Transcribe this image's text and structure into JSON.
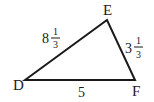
{
  "diagram": {
    "type": "triangle",
    "vertices": [
      {
        "id": "D",
        "label": "D",
        "x": 25,
        "y": 80
      },
      {
        "id": "E",
        "label": "E",
        "x": 107,
        "y": 20
      },
      {
        "id": "F",
        "label": "F",
        "x": 135,
        "y": 80
      }
    ],
    "sides": {
      "DE": {
        "whole": "8",
        "numerator": "1",
        "denominator": "3",
        "value": "8 1/3"
      },
      "EF": {
        "whole": "3",
        "numerator": "1",
        "denominator": "3",
        "value": "3 1/3"
      },
      "DF": {
        "whole": "5",
        "value": "5"
      }
    },
    "stroke_color": "#1a1a1a"
  }
}
